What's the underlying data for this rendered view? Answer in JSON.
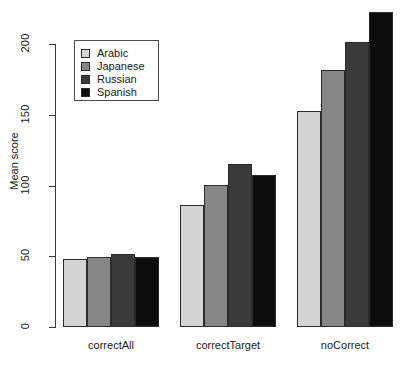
{
  "chart_data": {
    "type": "bar",
    "title": "",
    "subtitle": "",
    "xlabel": "",
    "ylabel": "Mean score",
    "categories": [
      "correctAll",
      "correctTarget",
      "noCorrect"
    ],
    "series": [
      {
        "name": "Arabic",
        "color": "#d4d4d4",
        "values": [
          48,
          86,
          152.5
        ]
      },
      {
        "name": "Japanese",
        "color": "#868686",
        "values": [
          49.5,
          100.5,
          181.5
        ]
      },
      {
        "name": "Russian",
        "color": "#3a3a3a",
        "values": [
          51.5,
          115,
          201.5
        ]
      },
      {
        "name": "Spanish",
        "color": "#0c0c0c",
        "values": [
          49.5,
          107.5,
          222.5
        ]
      }
    ],
    "ylim": [
      0,
      225
    ],
    "y_ticks": [
      "0",
      "50",
      "100",
      "150",
      "200"
    ],
    "y_tick_values": [
      0,
      50,
      100,
      150,
      200
    ],
    "grid": false,
    "legend": {
      "position": "top-left",
      "entries": [
        {
          "label": "Arabic",
          "swatch_color": "#d4d4d4"
        },
        {
          "label": "Japanese",
          "swatch_color": "#868686"
        },
        {
          "label": "Russian",
          "swatch_color": "#3a3a3a"
        },
        {
          "label": "Spanish",
          "swatch_color": "#0c0c0c"
        }
      ]
    }
  },
  "axis": {
    "y_title": "Mean score",
    "ticks": [
      {
        "label": "0"
      },
      {
        "label": "50"
      },
      {
        "label": "100"
      },
      {
        "label": "150"
      },
      {
        "label": "200"
      }
    ]
  },
  "groups": [
    {
      "label": "correctAll"
    },
    {
      "label": "correctTarget"
    },
    {
      "label": "noCorrect"
    }
  ],
  "legend": {
    "items": [
      {
        "label": "Arabic"
      },
      {
        "label": "Japanese"
      },
      {
        "label": "Russian"
      },
      {
        "label": "Spanish"
      }
    ]
  }
}
